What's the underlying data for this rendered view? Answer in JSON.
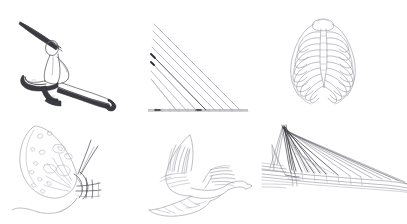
{
  "canvas": {
    "width": 407,
    "height": 224,
    "background_color": "#ffffff",
    "description": "Sheet of six hand-drawn pencil line sketches arranged in a two-row, three-column grid on a plain white background. No text, labels, captions, axis ticks or UI chrome appear anywhere in the image."
  },
  "palette": {
    "background": "#ffffff",
    "ink_dark": "#2b2b31",
    "ink_mid": "#4a4a52",
    "ink_light": "#8c8c96",
    "ink_faint": "#a9a9b2"
  },
  "grid": {
    "rows": 2,
    "columns": 3,
    "total_sketches": 6
  },
  "sketches": [
    {
      "id": "figure-lunge",
      "name": "Lunging human figure",
      "row": 1,
      "column": 1,
      "subject": "Stylised human figure in a deep warrior / lunge pose, one arm sweeping up and back to the upper left, torso leaning forward, front knee bent, rear leg extended far to the right, foot flexed.",
      "style": "Continuous contour line with heavy graphite shading along the underside of the legs and the rear foot.",
      "dominant_tone": "dark"
    },
    {
      "id": "line-fan-triangle",
      "name": "Radiating line fan over a baseline",
      "row": 1,
      "column": 2,
      "subject": "Geometric study: a bundle of parallel-ish straight rays descending from a short vertical stack of origin points at the upper left down to a horizontal ruled baseline, forming a right triangle silhouette.",
      "style": "Ruled straight strokes of varying weight; one central ray is drawn markedly darker than the rest.",
      "ray_count": 8,
      "dominant_tone": "light"
    },
    {
      "id": "ribcage",
      "name": "Human ribcage",
      "row": 1,
      "column": 3,
      "subject": "Anterior view of a human thorax: symmetrical ribcage with a central sternum column, curved costal arches sweeping down and outward on both sides, and the lower floating ribs flaring at the base.",
      "style": "Fine even outline, no shading.",
      "rib_pairs": 10,
      "dominant_tone": "light"
    },
    {
      "id": "butterfly-wing",
      "name": "Butterfly wing and body",
      "row": 2,
      "column": 1,
      "subject": "A large teardrop-shaped butterfly or moth forewing covered in scattered oval and chevron spot markings, attached to a slender segmented body at the right with thread-like legs and antennae, and a long trailing curved line sweeping away to the lower left.",
      "style": "Light contour outline with small enclosed spot shapes.",
      "dominant_tone": "light"
    },
    {
      "id": "bird-in-flight",
      "name": "Bird in flight",
      "row": 2,
      "column": 2,
      "subject": "A crow-like bird seen from the side in mid-flight: near wing raised high with splayed primary feathers, far wing sweeping low to the left, fanned tail extended to the right, head and beak tucked forward.",
      "style": "Quick gestural feather strokes over a light body outline.",
      "dominant_tone": "light"
    },
    {
      "id": "cable-stayed-bridge",
      "name": "Cable-stayed bridge",
      "row": 2,
      "column": 3,
      "subject": "Perspective view of a cable-stayed bridge: a tall angular pylon at the left with a dense fan of stay cables sweeping down and away to the right, meeting a long roadway deck that recedes to the right horizon, plus a short back-stay span at the far left.",
      "style": "Ruled converging cable lines, densest and darkest near the pylon.",
      "cable_count": 16,
      "dominant_tone": "mixed"
    }
  ]
}
